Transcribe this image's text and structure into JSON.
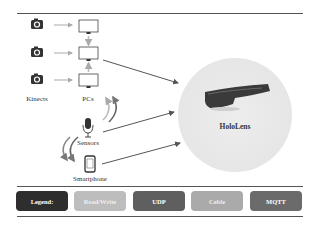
{
  "diagram": {
    "sources": {
      "kinects_label": "Kinects",
      "pcs_label": "PCs",
      "sensors_label": "Sensors",
      "smartphone_label": "Smartphone"
    },
    "target": {
      "label": "HoloLens"
    },
    "legend": {
      "title": "Legend:",
      "items": [
        {
          "label": "Read/Write",
          "color": "#bdbdbd"
        },
        {
          "label": "UDP",
          "color": "#5f5f5f"
        },
        {
          "label": "Cable",
          "color": "#aaaaaa"
        },
        {
          "label": "MQTT",
          "color": "#6b6b6b"
        }
      ],
      "title_color": "#2e2e2e"
    },
    "icons": {
      "camera": "camera-icon",
      "monitor": "monitor-icon",
      "microphone": "microphone-icon",
      "smartphone": "smartphone-icon",
      "headset": "hololens-headset-icon"
    }
  }
}
